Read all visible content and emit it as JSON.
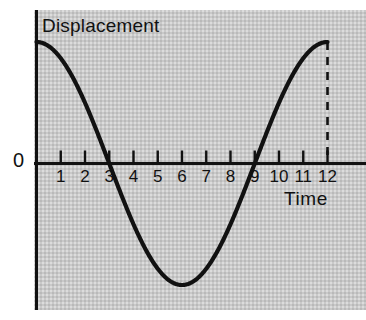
{
  "figure": {
    "background_color": "#ffffff",
    "panel_color": "#c9c9c9",
    "line_color": "#111111"
  },
  "labels": {
    "y_axis_title": "Displacement",
    "x_axis_title": "Time",
    "origin_label": "0"
  },
  "chart_data": {
    "type": "line",
    "title": "Displacement",
    "xlabel": "Time",
    "ylabel": "Displacement",
    "xlim": [
      0,
      13.6
    ],
    "ylim": [
      -1.05,
      1.05
    ],
    "grid": false,
    "legend": null,
    "x_ticks": [
      1,
      2,
      3,
      4,
      5,
      6,
      7,
      8,
      9,
      10,
      11,
      12
    ],
    "x_tick_labels": [
      "1",
      "2",
      "3",
      "4",
      "5",
      "6",
      "7",
      "8",
      "9",
      "10",
      "11",
      "12"
    ],
    "y_ticks": [
      0
    ],
    "y_tick_labels": [
      "0"
    ],
    "annotations": [
      {
        "name": "dashed-drop-line",
        "style": "dashed-vertical",
        "x": 12,
        "y_from": 1,
        "y_to": 0
      }
    ],
    "series": [
      {
        "name": "displacement",
        "form": "cosine",
        "amplitude": 1,
        "period": 12,
        "phase_deg": 0,
        "x_start": 0,
        "x_end": 12,
        "zero_crossings": [
          3,
          9
        ],
        "maxima": [
          {
            "x": 0,
            "y": 1
          },
          {
            "x": 12,
            "y": 1
          }
        ],
        "minima": [
          {
            "x": 6,
            "y": -1
          }
        ],
        "x": [
          0,
          0.5,
          1,
          1.5,
          2,
          2.5,
          3,
          3.5,
          4,
          4.5,
          5,
          5.5,
          6,
          6.5,
          7,
          7.5,
          8,
          8.5,
          9,
          9.5,
          10,
          10.5,
          11,
          11.5,
          12
        ],
        "y": [
          1.0,
          0.966,
          0.866,
          0.707,
          0.5,
          0.259,
          0.0,
          -0.259,
          -0.5,
          -0.707,
          -0.866,
          -0.966,
          -1.0,
          -0.966,
          -0.866,
          -0.707,
          -0.5,
          -0.259,
          0.0,
          0.259,
          0.5,
          0.707,
          0.866,
          0.966,
          1.0
        ]
      }
    ]
  }
}
